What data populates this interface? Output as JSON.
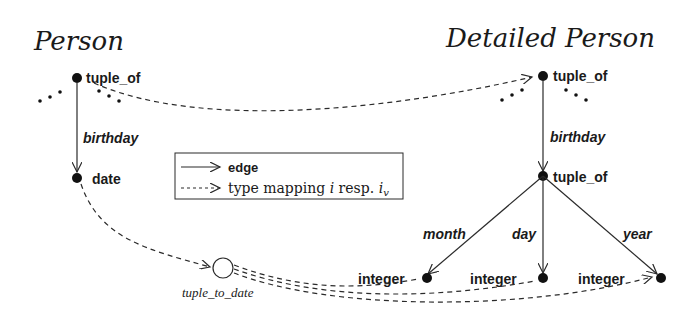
{
  "titles": {
    "left": "Person",
    "right": "Detailed Person"
  },
  "left_schema": {
    "root": "tuple_of",
    "edge": "birthday",
    "child": "date"
  },
  "right_schema": {
    "root": "tuple_of",
    "edge": "birthday",
    "child": "tuple_of",
    "sub_edges": [
      "month",
      "day",
      "year"
    ],
    "leaves": [
      "integer",
      "integer",
      "integer"
    ]
  },
  "function_node": {
    "label": "tuple_to_date"
  },
  "legend": {
    "edge_label": "edge",
    "mapping_prefix": "type mapping ",
    "mapping_i": "i",
    "mapping_mid": " resp. ",
    "mapping_iv": "i",
    "mapping_iv_sub": "v"
  },
  "ellipsis": "..."
}
